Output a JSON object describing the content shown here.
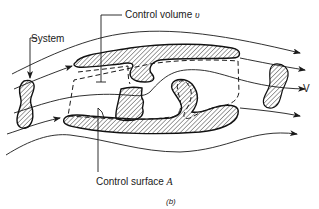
{
  "diagram": {
    "type": "fluid-mechanics-schematic",
    "labels": {
      "system": "System",
      "control_volume_text": "Control volume",
      "control_volume_symbol": "υ",
      "control_surface_text": "Control surface",
      "control_surface_symbol": "A",
      "velocity": "V",
      "caption": "(b)"
    },
    "elements": [
      {
        "id": "streamlines",
        "count": 6,
        "direction": "left-to-right"
      },
      {
        "id": "system-blob-left",
        "style": "hatched",
        "meaning": "System at earlier time"
      },
      {
        "id": "system-blob-right",
        "style": "hatched",
        "meaning": "System at later time"
      },
      {
        "id": "upper-body",
        "style": "hatched"
      },
      {
        "id": "lower-body",
        "style": "hatched"
      },
      {
        "id": "middle-block",
        "style": "hatched"
      },
      {
        "id": "control-surface",
        "style": "dashed"
      }
    ],
    "colors": {
      "ink": "#1a1a1a",
      "background": "#ffffff"
    }
  }
}
